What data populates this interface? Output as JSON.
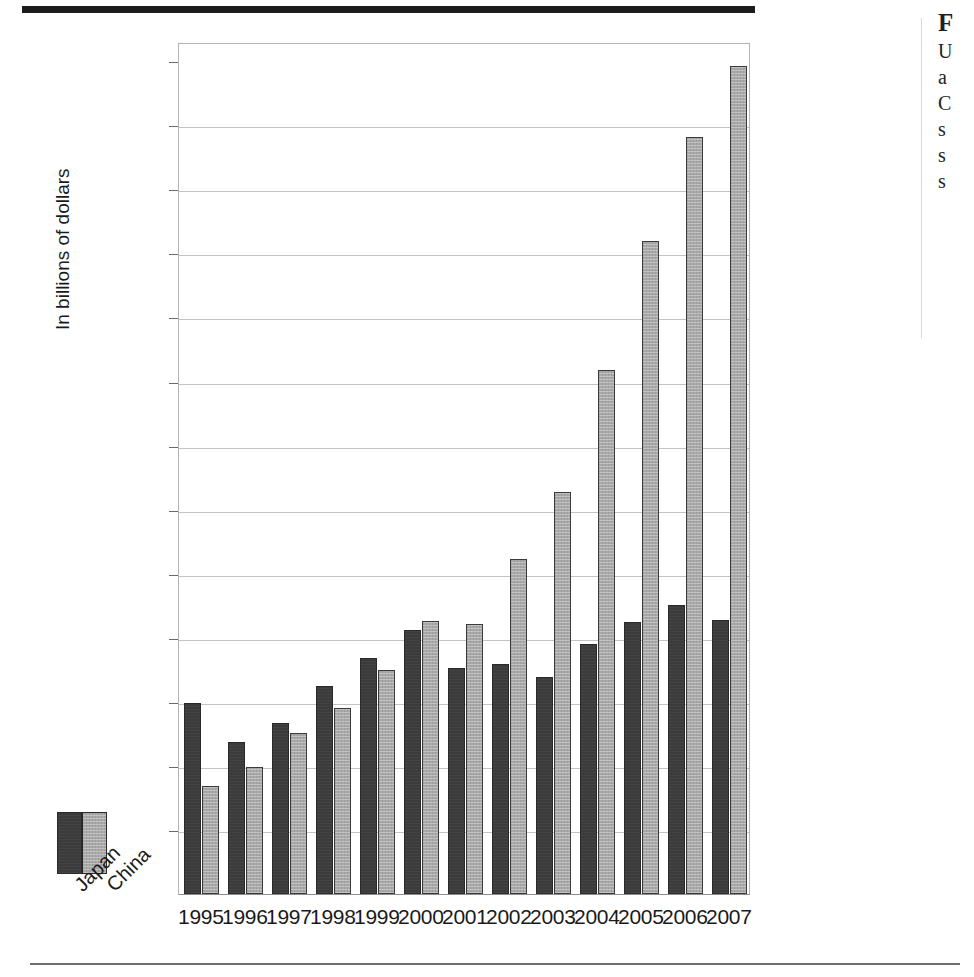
{
  "figure": {
    "y_axis_title": "In billions of dollars",
    "legend": {
      "items": [
        {
          "label": "Japan",
          "color": "#3b3b3b"
        },
        {
          "label": "China",
          "color": "#a9a9a9"
        }
      ]
    }
  },
  "right_column": {
    "heading": "F",
    "lines": [
      "U",
      "a",
      "C",
      "s",
      "s",
      "s"
    ]
  },
  "chart_data": {
    "type": "bar",
    "title": "",
    "xlabel": "",
    "ylabel": "In billions of dollars",
    "ylim": [
      0,
      266
    ],
    "yticks": [
      20,
      40,
      60,
      80,
      100,
      120,
      140,
      160,
      180,
      200,
      220,
      240,
      260
    ],
    "grid": true,
    "legend_position": "bottom-left",
    "categories": [
      "1995",
      "1996",
      "1997",
      "1998",
      "1999",
      "2000",
      "2001",
      "2002",
      "2003",
      "2004",
      "2005",
      "2006",
      "2007"
    ],
    "series": [
      {
        "name": "Japan",
        "color": "#3b3b3b",
        "values": [
          59.5,
          47.6,
          53.5,
          65.0,
          73.8,
          82.5,
          70.7,
          71.8,
          67.8,
          78.2,
          85.0,
          90.3,
          85.6
        ]
      },
      {
        "name": "China",
        "color": "#a9a9a9",
        "values": [
          33.8,
          39.8,
          50.2,
          58.0,
          70.0,
          85.1,
          84.4,
          104.6,
          125.6,
          163.7,
          204.0,
          236.3,
          258.5
        ]
      }
    ]
  }
}
